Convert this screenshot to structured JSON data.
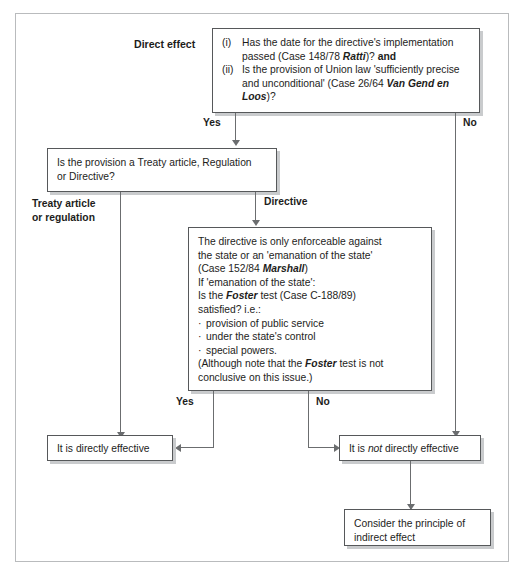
{
  "diagram": {
    "title_label": "Direct effect",
    "boxes": {
      "direct_effect_question": {
        "item1_marker": "(i)",
        "item1_line1": "Has the date for the directive's implementation",
        "item1_line2_pre": "passed (Case 148/78 ",
        "item1_line2_italic": "Ratti",
        "item1_line2_post": ")? ",
        "item1_line2_bold": "and",
        "item2_marker": "(ii)",
        "item2_line1": "Is the provision of Union law 'sufficiently precise",
        "item2_line2_pre": "and unconditional' (Case 26/64 ",
        "item2_line2_italic": "Van Gend en",
        "item2_line3_italic": "Loos",
        "item2_line3_post": ")?"
      },
      "provision_type_question": {
        "line1": "Is the provision a Treaty article, Regulation",
        "line2": "or Directive?"
      },
      "directive_enforceability": {
        "line1": "The directive is only enforceable against",
        "line2": "the state or an 'emanation of the state'",
        "line3_pre": "(Case 152/84 ",
        "line3_italic": "Marshall",
        "line3_post": ")",
        "line4": "If 'emanation of the state':",
        "line5_pre": "Is the ",
        "line5_italic": "Foster",
        "line5_post": " test (Case C-188/89)",
        "line6": "satisfied? i.e.:",
        "bullet1": "provision of public service",
        "bullet2": "under the state's control",
        "bullet3": "special powers.",
        "line7_pre": "(Although note that the ",
        "line7_italic": "Foster",
        "line7_post": " test is not",
        "line8": "conclusive on this issue.)"
      },
      "directly_effective": {
        "text": "It is directly effective"
      },
      "not_directly_effective": {
        "pre": "It is ",
        "italic": "not",
        "post": " directly effective"
      },
      "indirect_effect": {
        "line1": "Consider the principle of",
        "line2": "indirect effect"
      }
    },
    "edge_labels": {
      "yes_top": "Yes",
      "no_top": "No",
      "treaty_line1": "Treaty article",
      "treaty_line2": "or regulation",
      "directive": "Directive",
      "yes_bottom": "Yes",
      "no_bottom": "No"
    },
    "colors": {
      "box_border": "#56585a",
      "box_shadow": "#c9cbcd",
      "frame_border": "#b9bbbd",
      "connector": "#6b6d6f",
      "text": "#1d1d1b",
      "background": "#ffffff"
    }
  }
}
